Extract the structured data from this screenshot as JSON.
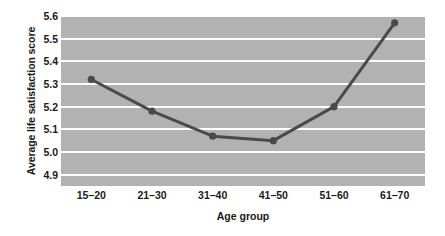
{
  "chart_data": {
    "type": "line",
    "title": "",
    "xlabel": "Age group",
    "ylabel": "Average life satisfaction score",
    "categories": [
      "15–20",
      "21–30",
      "31–40",
      "41–50",
      "51–60",
      "61–70"
    ],
    "values": [
      5.32,
      5.18,
      5.07,
      5.05,
      5.2,
      5.57
    ],
    "series": [
      {
        "name": "Average life satisfaction score",
        "values": [
          5.32,
          5.18,
          5.07,
          5.05,
          5.2,
          5.57
        ]
      }
    ],
    "ylim": [
      4.85,
      5.6
    ],
    "yticks": [
      "5.6",
      "5.5",
      "5.4",
      "5.3",
      "5.2",
      "5.1",
      "5.0",
      "4.9"
    ],
    "ytick_values": [
      5.6,
      5.5,
      5.4,
      5.3,
      5.2,
      5.1,
      5.0,
      4.9
    ],
    "grid": true,
    "legend": "none",
    "colors": {
      "plot_background": "#b2b2b2",
      "gridline": "#fdfdfd",
      "series_line": "#4a4a4a",
      "marker": "#4a4a4a",
      "text": "#1a1a1a",
      "page_background": "#ffffff"
    }
  }
}
